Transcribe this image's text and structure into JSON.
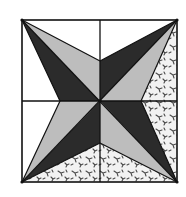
{
  "figure": {
    "frame": {
      "x1": 22,
      "y1": 20,
      "x2": 177,
      "y2": 182
    },
    "center": {
      "x": 100,
      "y": 101
    },
    "notches": {
      "top": {
        "x": 100,
        "y": 61
      },
      "right": {
        "x": 141,
        "y": 101
      },
      "bottom": {
        "x": 100,
        "y": 143
      },
      "left": {
        "x": 60,
        "y": 101
      }
    },
    "colors": {
      "dark": "#2b2b2b",
      "light": "#bdbdbd",
      "background": "#ffffff",
      "print_bg": "#f2f2f2",
      "print_ink": "#4a4a4a",
      "line": "#111111"
    },
    "regions": [
      {
        "name": "dark-triangle-top-left",
        "fill": "dark"
      },
      {
        "name": "light-triangle-top-left",
        "fill": "light"
      },
      {
        "name": "dark-triangle-top-right",
        "fill": "dark"
      },
      {
        "name": "light-triangle-top-right",
        "fill": "light"
      },
      {
        "name": "dark-triangle-bottom-right",
        "fill": "dark"
      },
      {
        "name": "light-triangle-bottom-right",
        "fill": "light"
      },
      {
        "name": "dark-triangle-bottom-left",
        "fill": "dark"
      },
      {
        "name": "light-triangle-bottom-left",
        "fill": "light"
      },
      {
        "name": "print-region-right",
        "fill": "print"
      },
      {
        "name": "print-region-bottom",
        "fill": "print"
      }
    ]
  }
}
